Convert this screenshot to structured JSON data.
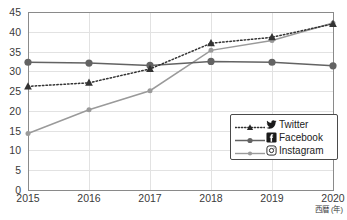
{
  "chart_data": {
    "type": "line",
    "title": "",
    "xlabel": "西暦 (年)",
    "ylabel": "",
    "categories": [
      "2015",
      "2016",
      "2017",
      "2018",
      "2019",
      "2020"
    ],
    "x": [
      2015,
      2016,
      2017,
      2018,
      2019,
      2020
    ],
    "xlim": [
      2015,
      2020
    ],
    "ylim": [
      0,
      45
    ],
    "ytick_labels": [
      "0",
      "5",
      "10",
      "15",
      "20",
      "25",
      "30",
      "35",
      "40",
      "45"
    ],
    "yticks": [
      0,
      5,
      10,
      15,
      20,
      25,
      30,
      35,
      40,
      45
    ],
    "grid": true,
    "legend_position": "lower-right-inside",
    "series": [
      {
        "name": "Twitter",
        "icon": "twitter-bird-icon",
        "values": [
          26.2,
          27.1,
          30.6,
          37.1,
          38.6,
          42.0
        ],
        "color": "#333333",
        "line_style": "dotted",
        "marker": "triangle"
      },
      {
        "name": "Facebook",
        "icon": "facebook-f-icon",
        "values": [
          32.3,
          32.1,
          31.5,
          32.5,
          32.3,
          31.4
        ],
        "color": "#636363",
        "line_style": "solid",
        "marker": "circle"
      },
      {
        "name": "Instagram",
        "icon": "instagram-camera-icon",
        "values": [
          14.3,
          20.3,
          25.1,
          35.3,
          37.8,
          42.2
        ],
        "color": "#9a9a9a",
        "line_style": "solid",
        "marker": "diamond"
      }
    ]
  },
  "legend": {
    "items": [
      {
        "label": "Twitter"
      },
      {
        "label": "Facebook"
      },
      {
        "label": "Instagram"
      }
    ]
  },
  "axes": {
    "x_title": "西暦 (年)"
  },
  "colors": {
    "twitter": "#333333",
    "facebook": "#636363",
    "instagram": "#9a9a9a",
    "grid": "#e2e2e2",
    "frame": "#8a8a8a"
  }
}
